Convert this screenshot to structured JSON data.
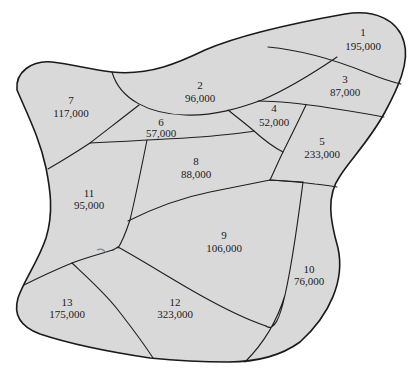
{
  "figure": {
    "type": "district-map",
    "fill_color": "#d9d9d9",
    "border_color": "#1a1a1a",
    "background_color": "#ffffff"
  },
  "regions": [
    {
      "id": "1",
      "population": "195,000",
      "x": 378,
      "y": 35
    },
    {
      "id": "2",
      "population": "96,000",
      "x": 200,
      "y": 87
    },
    {
      "id": "3",
      "population": "87,000",
      "x": 344,
      "y": 80
    },
    {
      "id": "4",
      "population": "52,000",
      "x": 273,
      "y": 112
    },
    {
      "id": "5",
      "population": "233,000",
      "x": 322,
      "y": 146
    },
    {
      "id": "6",
      "population": "57,000",
      "x": 161,
      "y": 125
    },
    {
      "id": "7",
      "population": "117,000",
      "x": 71,
      "y": 105
    },
    {
      "id": "8",
      "population": "88,000",
      "x": 196,
      "y": 166
    },
    {
      "id": "9",
      "population": "106,000",
      "x": 223,
      "y": 238
    },
    {
      "id": "10",
      "population": "76,000",
      "x": 308,
      "y": 274
    },
    {
      "id": "11",
      "population": "95,000",
      "x": 88,
      "y": 199
    },
    {
      "id": "12",
      "population": "323,000",
      "x": 174,
      "y": 308
    },
    {
      "id": "13",
      "population": "175,000",
      "x": 66,
      "y": 308
    }
  ]
}
